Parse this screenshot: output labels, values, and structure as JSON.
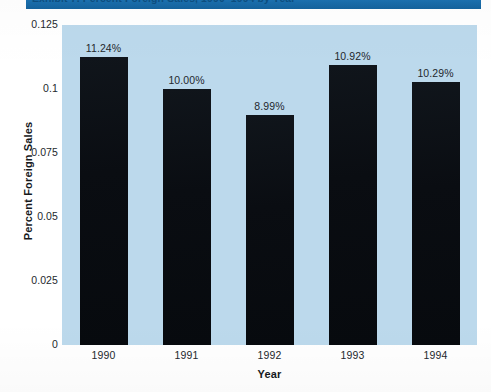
{
  "banner": {
    "title": "Exhibit 7. Percent Foreign Sales, 1990–1994 by Year"
  },
  "chart_data": {
    "type": "bar",
    "title": "Exhibit 7. Percent Foreign Sales, 1990–1994 by Year",
    "categories": [
      "1990",
      "1991",
      "1992",
      "1993",
      "1994"
    ],
    "values": [
      0.1124,
      0.1,
      0.0899,
      0.1092,
      0.1029
    ],
    "data_labels": [
      "11.24%",
      "10.00%",
      "8.99%",
      "10.92%",
      "10.29%"
    ],
    "xlabel": "Year",
    "ylabel": "Percent Foreign Sales",
    "ylim": [
      0,
      0.125
    ],
    "yticks": [
      "0",
      "0.025",
      "0.05",
      "0.075",
      "0.1",
      "0.125"
    ],
    "ytick_values": [
      0,
      0.025,
      0.05,
      0.075,
      0.1,
      0.125
    ],
    "grid": false,
    "legend": null,
    "bar_color": "#0d1117",
    "plot_background": "#bcd9ec",
    "figure_background": "#ffffff"
  }
}
